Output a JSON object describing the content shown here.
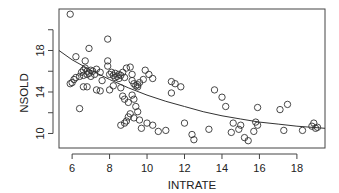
{
  "chart_data": {
    "type": "scatter",
    "title": "",
    "xlabel": "INTRATE",
    "ylabel": "NSOLD",
    "xlim": [
      5.3,
      19.5
    ],
    "ylim": [
      8.6,
      22.0
    ],
    "x_ticks": [
      6,
      8,
      10,
      12,
      14,
      16,
      18
    ],
    "x_tick_labels": [
      "6",
      "8",
      "10",
      "12",
      "14",
      "16",
      "18"
    ],
    "y_ticks": [
      10,
      12,
      14,
      16,
      18,
      20
    ],
    "y_tick_labels": [
      "10",
      "",
      "14",
      "",
      "18",
      ""
    ],
    "grid": false,
    "legend": "none",
    "series": [
      {
        "name": "observations",
        "marker": "open-circle",
        "points": [
          [
            5.9,
            21.5
          ],
          [
            7.9,
            19.1
          ],
          [
            6.9,
            18.2
          ],
          [
            6.2,
            17.4
          ],
          [
            6.7,
            17.0
          ],
          [
            7.9,
            17.0
          ],
          [
            5.9,
            14.8
          ],
          [
            6.0,
            14.9
          ],
          [
            6.1,
            15.2
          ],
          [
            6.2,
            15.4
          ],
          [
            6.4,
            15.5
          ],
          [
            6.5,
            15.9
          ],
          [
            6.6,
            16.1
          ],
          [
            6.6,
            15.6
          ],
          [
            6.7,
            16.3
          ],
          [
            6.8,
            15.7
          ],
          [
            6.8,
            16.0
          ],
          [
            6.9,
            15.8
          ],
          [
            7.0,
            16.1
          ],
          [
            7.0,
            15.5
          ],
          [
            7.1,
            16.0
          ],
          [
            7.2,
            15.7
          ],
          [
            7.3,
            16.2
          ],
          [
            7.5,
            15.9
          ],
          [
            7.6,
            15.1
          ],
          [
            6.6,
            14.5
          ],
          [
            6.8,
            14.5
          ],
          [
            7.3,
            14.2
          ],
          [
            7.5,
            14.1
          ],
          [
            6.4,
            12.4
          ],
          [
            7.9,
            16.5
          ],
          [
            8.0,
            15.7
          ],
          [
            8.1,
            15.9
          ],
          [
            8.2,
            15.6
          ],
          [
            8.3,
            15.4
          ],
          [
            8.3,
            15.8
          ],
          [
            8.4,
            15.5
          ],
          [
            8.5,
            15.7
          ],
          [
            8.5,
            15.3
          ],
          [
            8.6,
            15.6
          ],
          [
            8.7,
            15.9
          ],
          [
            8.8,
            15.4
          ],
          [
            8.9,
            16.3
          ],
          [
            9.1,
            16.4
          ],
          [
            9.2,
            15.7
          ],
          [
            8.0,
            14.2
          ],
          [
            8.2,
            14.6
          ],
          [
            8.6,
            14.4
          ],
          [
            8.7,
            13.6
          ],
          [
            8.8,
            13.3
          ],
          [
            9.0,
            13.0
          ],
          [
            9.2,
            15.1
          ],
          [
            9.3,
            14.8
          ],
          [
            9.4,
            14.6
          ],
          [
            9.5,
            14.5
          ],
          [
            9.5,
            14.7
          ],
          [
            9.6,
            14.9
          ],
          [
            9.8,
            15.2
          ],
          [
            9.9,
            16.1
          ],
          [
            10.1,
            15.7
          ],
          [
            10.3,
            15.3
          ],
          [
            9.2,
            13.7
          ],
          [
            9.3,
            13.3
          ],
          [
            9.4,
            12.6
          ],
          [
            9.5,
            12.1
          ],
          [
            9.1,
            11.9
          ],
          [
            9.0,
            11.6
          ],
          [
            8.9,
            11.2
          ],
          [
            8.8,
            11.0
          ],
          [
            8.6,
            10.8
          ],
          [
            9.3,
            11.5
          ],
          [
            9.6,
            11.3
          ],
          [
            10.0,
            11.0
          ],
          [
            10.3,
            10.8
          ],
          [
            9.7,
            10.5
          ],
          [
            10.6,
            10.2
          ],
          [
            11.0,
            10.3
          ],
          [
            11.3,
            15.0
          ],
          [
            11.5,
            14.8
          ],
          [
            11.8,
            14.5
          ],
          [
            11.3,
            13.9
          ],
          [
            12.0,
            11.0
          ],
          [
            12.5,
            9.4
          ],
          [
            12.4,
            9.9
          ],
          [
            13.3,
            10.4
          ],
          [
            13.6,
            14.2
          ],
          [
            14.0,
            13.5
          ],
          [
            14.2,
            12.6
          ],
          [
            14.5,
            10.1
          ],
          [
            14.6,
            11.0
          ],
          [
            14.9,
            10.4
          ],
          [
            15.0,
            10.8
          ],
          [
            15.2,
            9.6
          ],
          [
            15.4,
            9.3
          ],
          [
            15.8,
            11.1
          ],
          [
            15.9,
            10.8
          ],
          [
            15.9,
            12.5
          ],
          [
            15.7,
            10.2
          ],
          [
            17.1,
            12.3
          ],
          [
            17.5,
            12.8
          ],
          [
            17.3,
            10.3
          ],
          [
            18.3,
            10.3
          ],
          [
            18.8,
            10.7
          ],
          [
            18.9,
            11.0
          ],
          [
            19.0,
            10.5
          ],
          [
            19.1,
            10.6
          ]
        ]
      },
      {
        "name": "fitted curve",
        "type": "line",
        "points": [
          [
            5.3,
            18.0
          ],
          [
            6.0,
            17.1
          ],
          [
            7.0,
            16.1
          ],
          [
            8.0,
            15.2
          ],
          [
            9.0,
            14.4
          ],
          [
            10.0,
            13.7
          ],
          [
            11.0,
            13.1
          ],
          [
            12.0,
            12.6
          ],
          [
            13.0,
            12.1
          ],
          [
            14.0,
            11.7
          ],
          [
            15.0,
            11.4
          ],
          [
            16.0,
            11.1
          ],
          [
            17.0,
            10.9
          ],
          [
            18.0,
            10.7
          ],
          [
            19.5,
            10.5
          ]
        ]
      }
    ]
  }
}
